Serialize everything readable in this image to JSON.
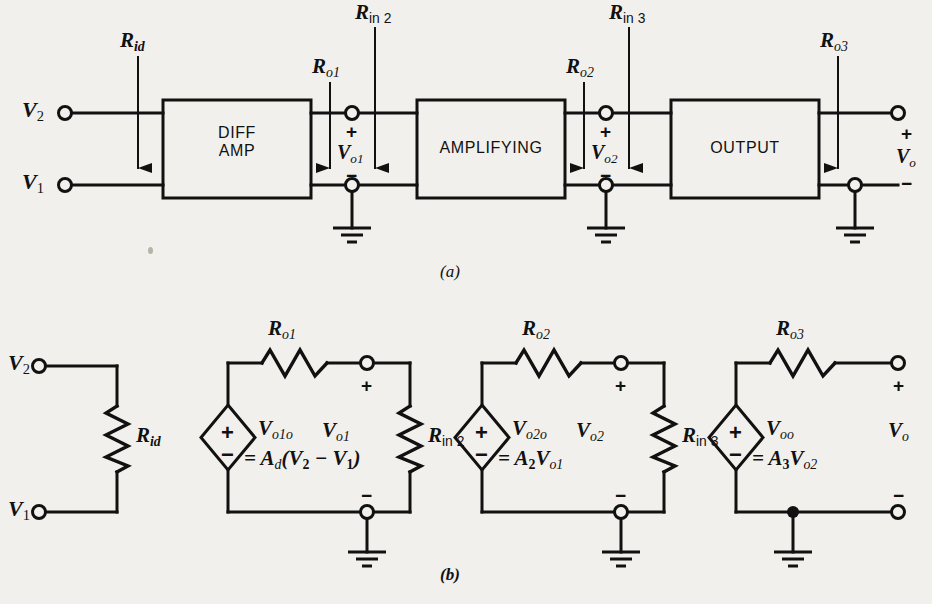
{
  "figure": {
    "caption_a": "(a)",
    "caption_b": "(b)",
    "line_color": "#111111",
    "background": "#f2f0ec"
  },
  "block_diagram": {
    "name": "(a) block diagram",
    "blocks": [
      {
        "id": "diff-amp",
        "line1": "DIFF",
        "line2": "AMP"
      },
      {
        "id": "amplifying",
        "line1": "AMPLIFYING",
        "line2": ""
      },
      {
        "id": "output",
        "line1": "OUTPUT",
        "line2": ""
      }
    ],
    "input_terminals": [
      {
        "id": "v2",
        "R": "R",
        "sub": "2"
      },
      {
        "id": "v1",
        "R": "R",
        "sub": "1"
      }
    ],
    "labels": {
      "v2": {
        "base": "V",
        "sub": "2"
      },
      "v1": {
        "base": "V",
        "sub": "1"
      },
      "rid": {
        "base": "R",
        "sub": "id"
      },
      "ro1": {
        "base": "R",
        "sub": "o1"
      },
      "rin2": {
        "base": "R",
        "sub": "in 2"
      },
      "ro2": {
        "base": "R",
        "sub": "o2"
      },
      "rin3": {
        "base": "R",
        "sub": "in 3"
      },
      "ro3": {
        "base": "R",
        "sub": "o3"
      },
      "vo1": {
        "base": "V",
        "sub": "o1"
      },
      "vo2": {
        "base": "V",
        "sub": "o2"
      },
      "vo": {
        "base": "V",
        "sub": "o"
      }
    },
    "polarity_plus": "+",
    "polarity_minus": "−",
    "ground_count": 3
  },
  "equivalent_circuit": {
    "name": "(b) equivalent circuit",
    "stages": [
      {
        "id": "input-stage",
        "elements": [
          "Rid"
        ],
        "resistor_label": {
          "base": "R",
          "sub": "id"
        },
        "terminals": [
          {
            "base": "V",
            "sub": "2"
          },
          {
            "base": "V",
            "sub": "1"
          }
        ]
      },
      {
        "id": "stage-1",
        "series_resistor": {
          "base": "R",
          "sub": "o1"
        },
        "source_label": {
          "base": "V",
          "sub": "o1o"
        },
        "source_equation": {
          "prefix": "= A",
          "gain_sub": "d",
          "expr_open": "(V",
          "v_a_sub": "2",
          "minus": " − V",
          "v_b_sub": "1",
          "expr_close": ")"
        },
        "node_label": {
          "base": "V",
          "sub": "o1"
        },
        "load_resistor": {
          "base": "R",
          "sub": "in 2"
        },
        "grounded": true
      },
      {
        "id": "stage-2",
        "series_resistor": {
          "base": "R",
          "sub": "o2"
        },
        "source_label": {
          "base": "V",
          "sub": "o2o"
        },
        "source_equation": {
          "prefix": "= A",
          "gain_sub": "2",
          "expr_open": "V",
          "v_a_sub": "o1",
          "minus": "",
          "v_b_sub": "",
          "expr_close": ""
        },
        "node_label": {
          "base": "V",
          "sub": "o2"
        },
        "load_resistor": {
          "base": "R",
          "sub": "in 3"
        },
        "grounded": true
      },
      {
        "id": "stage-3",
        "series_resistor": {
          "base": "R",
          "sub": "o3"
        },
        "source_label": {
          "base": "V",
          "sub": "oo"
        },
        "source_equation": {
          "prefix": "= A",
          "gain_sub": "3",
          "expr_open": "V",
          "v_a_sub": "o2",
          "minus": "",
          "v_b_sub": "",
          "expr_close": ""
        },
        "node_label": {
          "base": "V",
          "sub": "o"
        },
        "load_resistor": null,
        "grounded": true
      }
    ],
    "polarity_plus": "+",
    "polarity_minus": "−"
  }
}
